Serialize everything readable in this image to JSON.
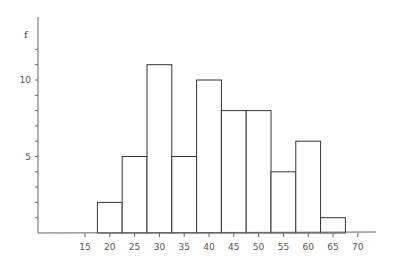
{
  "chart_data": {
    "type": "bar",
    "subtype": "histogram",
    "title": "",
    "xlabel": "",
    "ylabel": "f",
    "bins": [
      {
        "from": 17.5,
        "to": 22.5,
        "value": 2
      },
      {
        "from": 22.5,
        "to": 27.5,
        "value": 5
      },
      {
        "from": 27.5,
        "to": 32.5,
        "value": 11
      },
      {
        "from": 32.5,
        "to": 37.5,
        "value": 5
      },
      {
        "from": 37.5,
        "to": 42.5,
        "value": 10
      },
      {
        "from": 42.5,
        "to": 47.5,
        "value": 8
      },
      {
        "from": 47.5,
        "to": 52.5,
        "value": 8
      },
      {
        "from": 52.5,
        "to": 57.5,
        "value": 4
      },
      {
        "from": 57.5,
        "to": 62.5,
        "value": 6
      },
      {
        "from": 62.5,
        "to": 67.5,
        "value": 1
      }
    ],
    "categories": [
      "20",
      "25",
      "30",
      "35",
      "40",
      "45",
      "50",
      "55",
      "60",
      "65"
    ],
    "values": [
      2,
      5,
      11,
      5,
      10,
      8,
      8,
      4,
      6,
      1
    ],
    "x_ticks": [
      15,
      20,
      25,
      30,
      35,
      40,
      45,
      50,
      55,
      60,
      65,
      70
    ],
    "y_tick_labels": [
      5,
      10
    ],
    "y_minor_tick_step": 1,
    "xlim": [
      7.5,
      73.5
    ],
    "ylim": [
      0,
      14
    ],
    "grid": false,
    "legend": null
  },
  "colors": {
    "bar_fill": "#ffffff",
    "bar_stroke": "#333333",
    "axis": "#555555",
    "text": "#555555"
  }
}
